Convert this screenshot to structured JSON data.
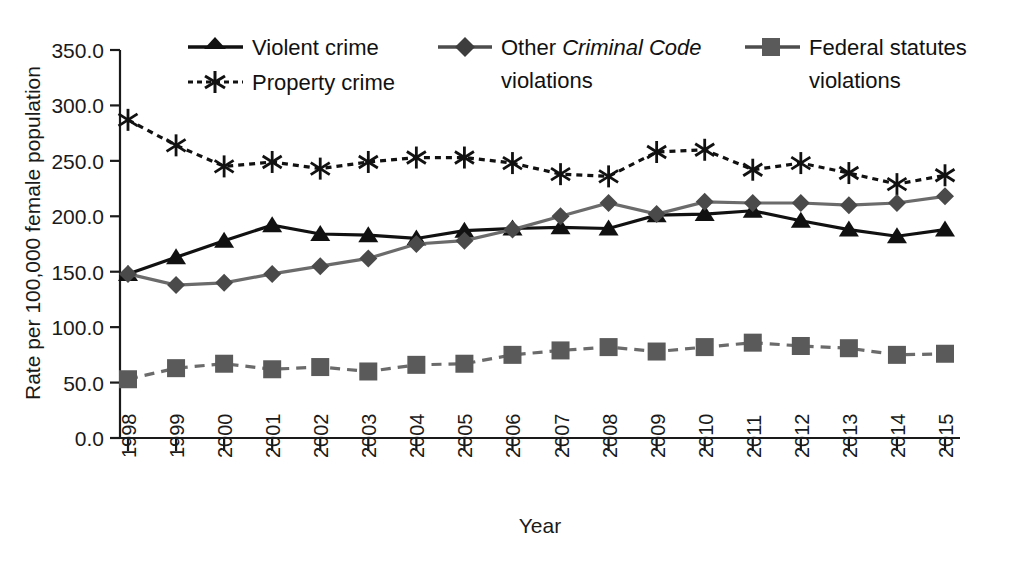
{
  "chart_data": {
    "type": "line",
    "title": "",
    "xlabel": "Year",
    "ylabel": "Rate per 100,000 female population",
    "x": [
      1998,
      1999,
      2000,
      2001,
      2002,
      2003,
      2004,
      2005,
      2006,
      2007,
      2008,
      2009,
      2010,
      2011,
      2012,
      2013,
      2014,
      2015
    ],
    "xtick_labels": [
      "1998",
      "1999",
      "2000",
      "2001",
      "2002",
      "2003",
      "2004",
      "2005",
      "2006",
      "2007",
      "2008",
      "2009",
      "2010",
      "2011",
      "2012",
      "2013",
      "2014",
      "2015"
    ],
    "ytick_labels": [
      "0.0",
      "50.0",
      "100.0",
      "150.0",
      "200.0",
      "250.0",
      "300.0",
      "350.0"
    ],
    "ytick_values": [
      0,
      50,
      100,
      150,
      200,
      250,
      300,
      350
    ],
    "ylim": [
      0,
      350
    ],
    "grid": false,
    "legend_position": "top",
    "series": [
      {
        "name": "Violent crime",
        "marker": "triangle",
        "line_style": "solid",
        "color": "#111111",
        "values": [
          148,
          163,
          178,
          192,
          184,
          183,
          180,
          187,
          189,
          190,
          189,
          201,
          202,
          205,
          196,
          188,
          182,
          188
        ]
      },
      {
        "name": "Property crime",
        "marker": "asterisk",
        "line_style": "dotted",
        "color": "#111111",
        "values": [
          287,
          264,
          245,
          249,
          243,
          249,
          253,
          253,
          248,
          238,
          236,
          258,
          260,
          242,
          248,
          239,
          229,
          237
        ]
      },
      {
        "name": "Other Criminal Code violations",
        "marker": "diamond",
        "line_style": "solid",
        "color": "#6b6b6b",
        "legend_italic_part": "Criminal Code",
        "values": [
          148,
          138,
          140,
          148,
          155,
          162,
          175,
          178,
          188,
          200,
          212,
          202,
          213,
          212,
          212,
          210,
          212,
          218
        ]
      },
      {
        "name": "Federal statutes violations",
        "marker": "square",
        "line_style": "dashed",
        "color": "#6b6b6b",
        "values": [
          53,
          63,
          67,
          62,
          64,
          60,
          66,
          67,
          75,
          79,
          82,
          78,
          82,
          86,
          83,
          81,
          75,
          76
        ]
      }
    ]
  },
  "legend": {
    "items": [
      {
        "label": "Violent crime",
        "name": "legend-violent-crime"
      },
      {
        "label": "Property crime",
        "name": "legend-property-crime"
      },
      {
        "label_pre": "Other ",
        "label_ital": "Criminal Code",
        "label_post": "",
        "label_line2": "violations",
        "name": "legend-other-criminal-code"
      },
      {
        "label": "Federal statutes",
        "label_line2": "violations",
        "name": "legend-federal-statutes"
      }
    ]
  },
  "colors": {
    "black": "#111111",
    "grey": "#6b6b6b",
    "axis": "#1a1a1a",
    "background": "#ffffff"
  }
}
